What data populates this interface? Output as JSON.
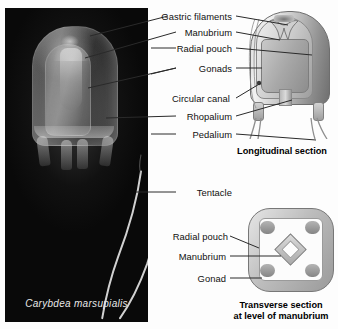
{
  "figure": {
    "species_caption": "Carybdea marsupialis",
    "labels_left": [
      {
        "id": "gastric-filaments",
        "text": "Gastric filaments"
      },
      {
        "id": "manubrium",
        "text": "Manubrium"
      },
      {
        "id": "radial-pouch",
        "text": "Radial pouch"
      },
      {
        "id": "gonads",
        "text": "Gonads"
      },
      {
        "id": "circular-canal",
        "text": "Circular canal"
      },
      {
        "id": "rhopalium",
        "text": "Rhopalium"
      },
      {
        "id": "pedalium",
        "text": "Pedalium"
      },
      {
        "id": "tentacle",
        "text": "Tentacle"
      }
    ],
    "labels_transverse": [
      {
        "id": "radial-pouch-ts",
        "text": "Radial pouch"
      },
      {
        "id": "manubrium-ts",
        "text": "Manubrium"
      },
      {
        "id": "gonad-ts",
        "text": "Gonad"
      }
    ],
    "captions": {
      "longitudinal_line1": "Longitudinal section",
      "transverse_line1": "Transverse section",
      "transverse_line2": "at level of manubrium"
    },
    "colors": {
      "background": "#ffffff",
      "photo_background": "#090909",
      "text": "#111111",
      "leader_line": "#2a2a2a"
    }
  }
}
